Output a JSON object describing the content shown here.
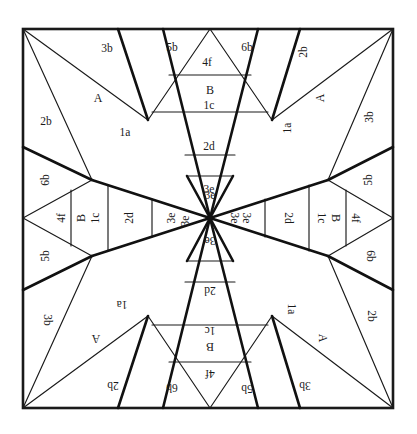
{
  "figure": {
    "type": "geometric-dissection-diagram",
    "center": {
      "x": 210,
      "y": 218
    },
    "frame": {
      "x": 23,
      "y": 29,
      "width": 370,
      "height": 379
    },
    "colors": {
      "background": "#ffffff",
      "stroke": "#1a1a1a",
      "thick_stroke": "#111111",
      "text": "#1a1a1a"
    },
    "line_widths": {
      "thin": 1,
      "medium": 1.4,
      "thick": 2.6,
      "frame": 2.6
    }
  },
  "geometry": {
    "frame_points": {
      "top_left": [
        23,
        29
      ],
      "top_right": [
        393,
        29
      ],
      "bottom_right": [
        393,
        408
      ],
      "bottom_left": [
        23,
        408
      ],
      "center": [
        210,
        218
      ],
      "top_apex": [
        210,
        29
      ],
      "bottom_apex": [
        210,
        408
      ],
      "left_apex": [
        23,
        218
      ],
      "right_apex": [
        393,
        218
      ],
      "top_left_mid": [
        23,
        147
      ],
      "top_right_mid": [
        393,
        147
      ],
      "bottom_left_mid": [
        23,
        290
      ],
      "bottom_right_mid": [
        393,
        290
      ],
      "top_edge_a": [
        118,
        29
      ],
      "top_edge_b": [
        163,
        29
      ],
      "top_edge_c": [
        258,
        29
      ],
      "top_edge_d": [
        300,
        29
      ],
      "bot_edge_a": [
        118,
        408
      ],
      "bot_edge_b": [
        163,
        408
      ],
      "bot_edge_c": [
        258,
        408
      ],
      "bot_edge_d": [
        300,
        408
      ],
      "inner_tl": [
        148,
        120
      ],
      "inner_tr": [
        272,
        120
      ],
      "inner_bl": [
        148,
        316
      ],
      "inner_br": [
        272,
        316
      ],
      "node_left_up": [
        92,
        180
      ],
      "node_left_dn": [
        92,
        256
      ],
      "node_right_up": [
        328,
        180
      ],
      "node_right_dn": [
        328,
        256
      ],
      "trap_top_y1": [
        169,
        75
      ],
      "trap_top_y2": [
        251,
        75
      ],
      "trap_mid_y1": [
        152,
        112
      ],
      "trap_mid_y2": [
        268,
        112
      ],
      "trap_low_y1": [
        185,
        155
      ],
      "trap_low_y2": [
        235,
        155
      ]
    }
  },
  "labels": {
    "top_edge": [
      {
        "text": "3b",
        "x": 107,
        "y": 49,
        "rotate": 0,
        "size": 11.5
      },
      {
        "text": "5b",
        "x": 172,
        "y": 48,
        "rotate": 0,
        "size": 11.5
      },
      {
        "text": "4f",
        "x": 207,
        "y": 63,
        "rotate": 0,
        "size": 11.5
      },
      {
        "text": "6b",
        "x": 247,
        "y": 48,
        "rotate": 0,
        "size": 11.5
      },
      {
        "text": "2b",
        "x": 304,
        "y": 52,
        "rotate": -90,
        "size": 11.5
      }
    ],
    "top_center_band": [
      {
        "text": "B",
        "x": 210,
        "y": 90,
        "rotate": 0,
        "size": 12
      },
      {
        "text": "1c",
        "x": 209,
        "y": 106,
        "rotate": 0,
        "size": 11.5
      },
      {
        "text": "2d",
        "x": 209,
        "y": 147,
        "rotate": 0,
        "size": 11.5
      },
      {
        "text": "3e",
        "x": 209,
        "y": 190,
        "rotate": 0,
        "size": 11.5
      }
    ],
    "upper_left_quadrant": [
      {
        "text": "2b",
        "x": 46,
        "y": 122,
        "rotate": 0,
        "size": 11.5
      },
      {
        "text": "A",
        "x": 98,
        "y": 98,
        "rotate": 0,
        "size": 12
      },
      {
        "text": "1a",
        "x": 125,
        "y": 133,
        "rotate": 0,
        "size": 11.5
      },
      {
        "text": "6b",
        "x": 46,
        "y": 180,
        "rotate": -90,
        "size": 11.5
      }
    ],
    "upper_right_quadrant": [
      {
        "text": "3b",
        "x": 370,
        "y": 117,
        "rotate": -90,
        "size": 11.5
      },
      {
        "text": "A",
        "x": 320,
        "y": 98,
        "rotate": -90,
        "size": 12
      },
      {
        "text": "1a",
        "x": 288,
        "y": 128,
        "rotate": -90,
        "size": 11.5
      },
      {
        "text": "5b",
        "x": 369,
        "y": 180,
        "rotate": -90,
        "size": 11.5
      }
    ],
    "left_band": [
      {
        "text": "4f",
        "x": 62,
        "y": 218,
        "rotate": -90,
        "size": 11.5
      },
      {
        "text": "B",
        "x": 81,
        "y": 218,
        "rotate": -90,
        "size": 12
      },
      {
        "text": "1c",
        "x": 96,
        "y": 218,
        "rotate": -90,
        "size": 11.5
      },
      {
        "text": "2d",
        "x": 130,
        "y": 218,
        "rotate": -90,
        "size": 11.5
      },
      {
        "text": "3e",
        "x": 172,
        "y": 218,
        "rotate": -90,
        "size": 11.5
      },
      {
        "text": "5b",
        "x": 46,
        "y": 256,
        "rotate": -90,
        "size": 11.5
      }
    ],
    "right_band": [
      {
        "text": "3e",
        "x": 246,
        "y": 218,
        "rotate": 90,
        "size": 11.5
      },
      {
        "text": "2d",
        "x": 288,
        "y": 218,
        "rotate": 90,
        "size": 11.5
      },
      {
        "text": "1c",
        "x": 321,
        "y": 218,
        "rotate": 90,
        "size": 11.5
      },
      {
        "text": "B",
        "x": 336,
        "y": 218,
        "rotate": 90,
        "size": 12
      },
      {
        "text": "4f",
        "x": 355,
        "y": 218,
        "rotate": 90,
        "size": 11.5
      },
      {
        "text": "6b",
        "x": 370,
        "y": 256,
        "rotate": 90,
        "size": 11.5
      }
    ],
    "center_wedges": [
      {
        "text": "3e",
        "x": 210,
        "y": 196,
        "rotate": 0,
        "size": 11.5
      },
      {
        "text": "3e",
        "x": 210,
        "y": 240,
        "rotate": 180,
        "size": 11.5
      },
      {
        "text": "3e",
        "x": 186,
        "y": 221,
        "rotate": -90,
        "size": 11.5
      },
      {
        "text": "3e",
        "x": 234,
        "y": 218,
        "rotate": 90,
        "size": 11.5
      }
    ],
    "lower_left_quadrant": [
      {
        "text": "3b",
        "x": 47,
        "y": 320,
        "rotate": 90,
        "size": 11.5
      },
      {
        "text": "A",
        "x": 96,
        "y": 339,
        "rotate": 180,
        "size": 12
      },
      {
        "text": "1a",
        "x": 122,
        "y": 304,
        "rotate": 180,
        "size": 11.5
      },
      {
        "text": "2b",
        "x": 113,
        "y": 385,
        "rotate": 180,
        "size": 11.5
      }
    ],
    "lower_right_quadrant": [
      {
        "text": "2b",
        "x": 371,
        "y": 316,
        "rotate": 90,
        "size": 11.5
      },
      {
        "text": "A",
        "x": 323,
        "y": 338,
        "rotate": 90,
        "size": 12
      },
      {
        "text": "1a",
        "x": 291,
        "y": 309,
        "rotate": 90,
        "size": 11.5
      },
      {
        "text": "3b",
        "x": 305,
        "y": 385,
        "rotate": 180,
        "size": 11.5
      }
    ],
    "bottom_center_band": [
      {
        "text": "2d",
        "x": 210,
        "y": 290,
        "rotate": 180,
        "size": 11.5
      },
      {
        "text": "1c",
        "x": 210,
        "y": 330,
        "rotate": 180,
        "size": 11.5
      },
      {
        "text": "B",
        "x": 210,
        "y": 347,
        "rotate": 180,
        "size": 12
      },
      {
        "text": "4f",
        "x": 210,
        "y": 373,
        "rotate": 180,
        "size": 11.5
      }
    ],
    "bottom_edge": [
      {
        "text": "6b",
        "x": 172,
        "y": 387,
        "rotate": 180,
        "size": 11.5
      },
      {
        "text": "5b",
        "x": 247,
        "y": 388,
        "rotate": 180,
        "size": 11.5
      }
    ]
  }
}
